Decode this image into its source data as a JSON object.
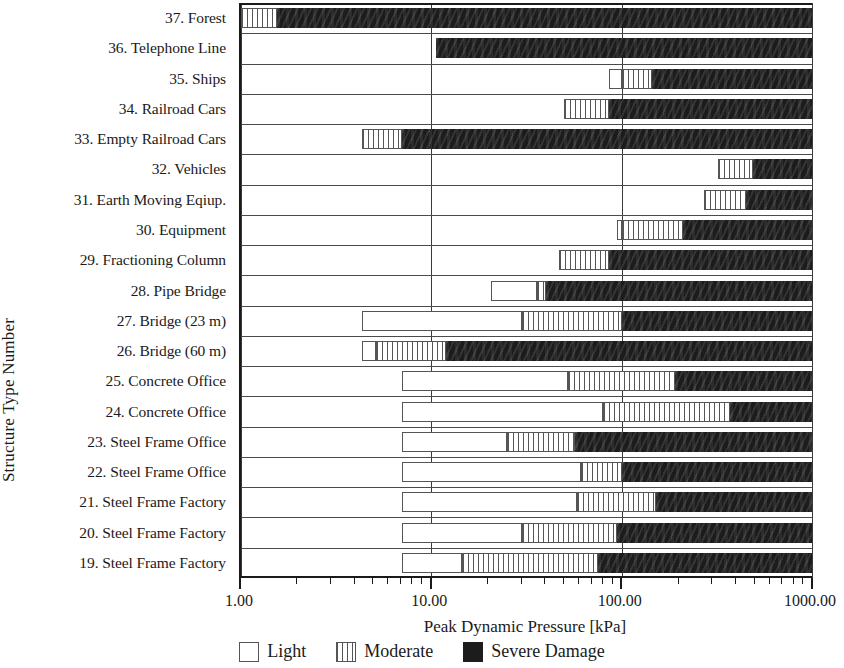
{
  "chart_data": {
    "type": "bar",
    "orientation": "horizontal",
    "stacked": true,
    "title": "",
    "xlabel": "Peak Dynamic Pressure [kPa]",
    "ylabel": "Structure Type Number",
    "xscale": "log",
    "xlim": [
      1.0,
      1000.0
    ],
    "xticks": [
      1.0,
      10.0,
      100.0,
      1000.0
    ],
    "xtick_labels": [
      "1.00",
      "10.00",
      "100.00",
      "1000.00"
    ],
    "grid": "vertical-major",
    "legend_position": "bottom",
    "legend": [
      {
        "name": "Light",
        "style": "open-white"
      },
      {
        "name": "Moderate",
        "style": "vertical-hatch"
      },
      {
        "name": "Severe Damage",
        "style": "solid-black"
      }
    ],
    "series": [
      {
        "name": "Light",
        "key": "light"
      },
      {
        "name": "Moderate",
        "key": "moderate"
      },
      {
        "name": "Severe Damage",
        "key": "severe"
      }
    ],
    "categories": [
      "37. Forest",
      "36. Telephone Line",
      "35. Ships",
      "34. Railroad Cars",
      "33. Empty Railroad Cars",
      "32. Vehicles",
      "31. Earth Moving Eqiup.",
      "30. Equipment",
      "29. Fractioning Column",
      "28. Pipe Bridge",
      "27. Bridge (23 m)",
      "26. Bridge (60 m)",
      "25. Concrete Office",
      "24. Concrete Office",
      "23. Steel Frame Office",
      "22. Steel Frame Office",
      "21. Steel Frame Factory",
      "20. Steel Frame Factory",
      "19. Steel Frame Factory"
    ],
    "rows": [
      {
        "label": "37. Forest",
        "light": null,
        "moderate": [
          1.0,
          1.55
        ],
        "severe": [
          1.55,
          1000.0
        ]
      },
      {
        "label": "36. Telephone Line",
        "light": null,
        "moderate": null,
        "severe": [
          10.6,
          1000.0
        ]
      },
      {
        "label": "35. Ships",
        "light": [
          86.0,
          100.0
        ],
        "moderate": [
          100.0,
          145.0
        ],
        "severe": [
          145.0,
          1000.0
        ]
      },
      {
        "label": "34. Railroad Cars",
        "light": null,
        "moderate": [
          50.0,
          86.0
        ],
        "severe": [
          86.0,
          1000.0
        ]
      },
      {
        "label": "33. Empty Railroad Cars",
        "light": null,
        "moderate": [
          4.3,
          7.0
        ],
        "severe": [
          7.0,
          1000.0
        ]
      },
      {
        "label": "32. Vehicles",
        "light": null,
        "moderate": [
          320.0,
          490.0
        ],
        "severe": [
          490.0,
          1000.0
        ]
      },
      {
        "label": "31. Earth Moving Eqiup.",
        "light": null,
        "moderate": [
          270.0,
          450.0
        ],
        "severe": [
          450.0,
          1000.0
        ]
      },
      {
        "label": "30. Equipment",
        "light": [
          94.0,
          100.0
        ],
        "moderate": [
          100.0,
          210.0
        ],
        "severe": [
          210.0,
          1000.0
        ]
      },
      {
        "label": "29. Fractioning Column",
        "light": null,
        "moderate": [
          47.0,
          86.0
        ],
        "severe": [
          86.0,
          1000.0
        ]
      },
      {
        "label": "28. Pipe Bridge",
        "light": [
          20.5,
          36.0
        ],
        "moderate": [
          36.0,
          40.0
        ],
        "severe": [
          40.0,
          1000.0
        ]
      },
      {
        "label": "27. Bridge (23 m)",
        "light": [
          4.3,
          30.0
        ],
        "moderate": [
          30.0,
          100.0
        ],
        "severe": [
          100.0,
          1000.0
        ]
      },
      {
        "label": "26. Bridge (60 m)",
        "light": [
          4.3,
          5.1
        ],
        "moderate": [
          5.1,
          12.0
        ],
        "severe": [
          12.0,
          1000.0
        ]
      },
      {
        "label": "25. Concrete Office",
        "light": [
          7.0,
          52.0
        ],
        "moderate": [
          52.0,
          190.0
        ],
        "severe": [
          190.0,
          1000.0
        ]
      },
      {
        "label": "24. Concrete Office",
        "light": [
          7.0,
          80.0
        ],
        "moderate": [
          80.0,
          370.0
        ],
        "severe": [
          370.0,
          1000.0
        ]
      },
      {
        "label": "23. Steel Frame Office",
        "light": [
          7.0,
          25.0
        ],
        "moderate": [
          25.0,
          57.0
        ],
        "severe": [
          57.0,
          1000.0
        ]
      },
      {
        "label": "22. Steel Frame Office",
        "light": [
          7.0,
          61.0
        ],
        "moderate": [
          61.0,
          100.0
        ],
        "severe": [
          100.0,
          1000.0
        ]
      },
      {
        "label": "21. Steel Frame Factory",
        "light": [
          7.0,
          58.0
        ],
        "moderate": [
          58.0,
          152.0
        ],
        "severe": [
          152.0,
          1000.0
        ]
      },
      {
        "label": "20. Steel Frame Factory",
        "light": [
          7.0,
          30.0
        ],
        "moderate": [
          30.0,
          94.0
        ],
        "severe": [
          94.0,
          1000.0
        ]
      },
      {
        "label": "19. Steel Frame Factory",
        "light": [
          7.0,
          14.5
        ],
        "moderate": [
          14.5,
          75.0
        ],
        "severe": [
          75.0,
          1000.0
        ]
      }
    ]
  },
  "axes": {
    "ylabel": "Structure Type Number",
    "xlabel": "Peak Dynamic Pressure [kPa]",
    "xtick_labels": [
      "1.00",
      "10.00",
      "100.00",
      "1000.00"
    ]
  },
  "legend": {
    "light": "Light",
    "moderate": "Moderate",
    "severe": "Severe Damage"
  },
  "colors": {
    "axis": "#1a1a1a",
    "grid": "#3a3a3a",
    "severe": "#1c1c1c",
    "hatch": "#555555",
    "light_fill": "#ffffff",
    "background": "#ffffff"
  }
}
